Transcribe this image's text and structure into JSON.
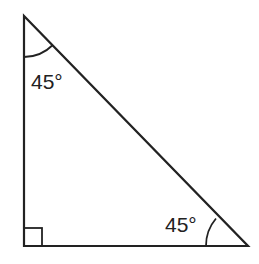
{
  "diagram": {
    "type": "right-isosceles-triangle",
    "angles": {
      "top": "45°",
      "bottom_right": "45°",
      "bottom_left": "90°"
    },
    "right_angle_marker": "square",
    "colors": {
      "stroke": "#222222",
      "background": "#ffffff"
    }
  }
}
